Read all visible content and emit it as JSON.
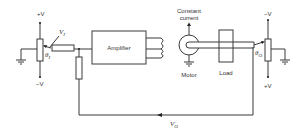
{
  "diagram": {
    "type": "servo-position-control-schematic",
    "input_pot": {
      "top_supply": "+V",
      "bottom_supply": "−V",
      "angle_label": "θ",
      "angle_sub": "I",
      "voltage_label": "V",
      "voltage_sub": "I"
    },
    "amplifier": {
      "label": "Amplifier"
    },
    "motor": {
      "top_label_line1": "Constant",
      "top_label_line2": "current",
      "label": "Motor"
    },
    "load": {
      "label": "Load"
    },
    "output_pot": {
      "top_supply": "−V",
      "bottom_supply": "+V",
      "angle_label": "θ",
      "angle_sub": "O"
    },
    "feedback": {
      "voltage_label": "V",
      "voltage_sub": "O"
    },
    "colors": {
      "line": "#3a3a3a",
      "text": "#333333",
      "background": "#ffffff"
    }
  }
}
